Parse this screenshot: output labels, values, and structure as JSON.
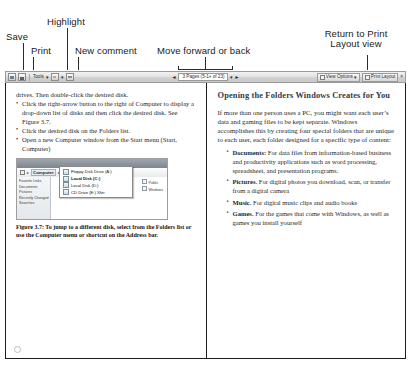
{
  "annotations": [
    {
      "id": "save",
      "label": "Save"
    },
    {
      "id": "print",
      "label": "Print"
    },
    {
      "id": "highlight",
      "label": "Highlight"
    },
    {
      "id": "new_comment",
      "label": "New comment"
    },
    {
      "id": "move_forward_back",
      "label": "Move forward or back"
    },
    {
      "id": "return_print_layout",
      "label": "Return to Print Layout view"
    }
  ],
  "toolbar": {
    "save_icon": "save-disk-icon",
    "print_icon": "printer-icon",
    "tools_label": "Tools",
    "highlight_icon": "highlighter-icon",
    "comment_icon": "new-comment-icon",
    "prev_arrow": "◄",
    "next_arrow": "►",
    "page_indicator": "3 Pages (5-1+ of 23)",
    "dropdown_caret": "▾",
    "view_options_label": "View Options",
    "print_layout_label": "Print Layout",
    "close_label": "×"
  },
  "document": {
    "left_column": {
      "intro_line": "drives. Then double-click the desired disk.",
      "steps": [
        "Click the right-arrow button to the right of Computer to display a drop-down list of disks and then click the desired disk. See Figure 3.7.",
        "Click the desired disk on the Folders list.",
        "Open a new Computer window from the Start menu (Start, Computer)"
      ],
      "figure": {
        "address_crumb_1": "Computer",
        "address_crumb_2": "Local Disk (C:)",
        "address_arrow": "▸",
        "nav_items": [
          "Favorite Links",
          "Documents",
          "Pictures",
          "Recently Changed",
          "Searches"
        ],
        "tree_items": [
          "Public",
          "Windows"
        ],
        "dropdown_items": [
          {
            "label": "Floppy Disk Drive (A:)",
            "selected": false
          },
          {
            "label": "Local Disk (C:)",
            "selected": true
          },
          {
            "label": "Local Disk (D:)",
            "selected": false
          },
          {
            "label": "CD Drive (E:) Xfer",
            "selected": false
          }
        ]
      },
      "caption": "Figure 3.7: To jump to a different disk, select from the Folders list or use the Computer menu or shortcut on the Address bar."
    },
    "right_column": {
      "heading": "Opening the Folders Windows Creates for You",
      "paragraph": "If more than one person uses a PC, you might want each user’s data and gaming files to be kept separate. Windows accomplishes this by creating four special folders that are unique to each user, each folder designed for a specific type of content:",
      "bullets": [
        {
          "term": "Documents:",
          "text": " For data files from information-based business and productivity applications such as word processing, spreadsheet, and presentation programs."
        },
        {
          "term": "Pictures.",
          "text": " For digital photos you download, scan, or transfer from a digital camera"
        },
        {
          "term": "Music.",
          "text": " For digital music clips and audio books"
        },
        {
          "term": "Games.",
          "text": " For the games that come with Windows, as well as games you install yourself"
        }
      ]
    }
  }
}
